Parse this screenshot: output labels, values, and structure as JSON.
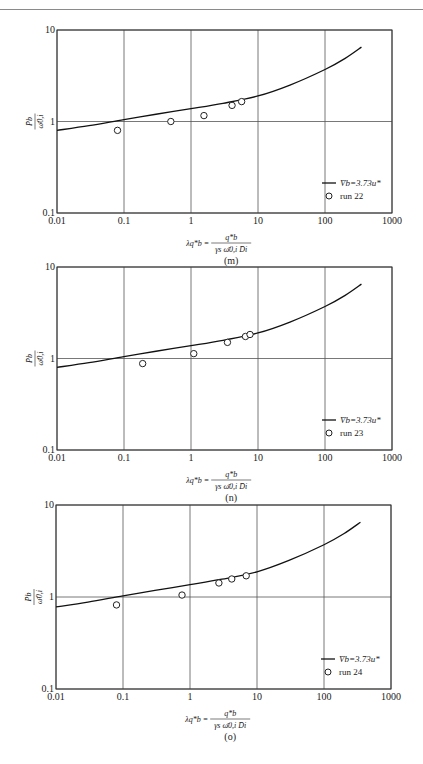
{
  "page_header": {
    "text": "······"
  },
  "chart_data": [
    {
      "id": "m",
      "type": "scatter",
      "title": "",
      "caption": "(m)",
      "xscale": "log",
      "yscale": "log",
      "xlim": [
        0.01,
        1000
      ],
      "ylim": [
        0.1,
        10
      ],
      "xticks": [
        "0.01",
        "0.1",
        "1",
        "10",
        "100",
        "1000"
      ],
      "yticks": [
        "0.1",
        "1",
        "10"
      ],
      "grid": true,
      "xlabel": "λq*b = q*b / (γs ω̄0,i D̄i)",
      "ylabel": "P̄b / ω̄0,i",
      "legend_position": "lower right",
      "series": [
        {
          "name": "V̄b=3.73u*",
          "kind": "line",
          "x": [
            0.01,
            0.03,
            0.1,
            0.3,
            1,
            3,
            10,
            30,
            100,
            200,
            350
          ],
          "y": [
            0.8,
            0.9,
            1.05,
            1.2,
            1.38,
            1.58,
            1.9,
            2.5,
            3.7,
            4.9,
            6.5
          ]
        },
        {
          "name": "run 22",
          "kind": "markers",
          "marker": "open-circle",
          "x": [
            0.08,
            0.5,
            1.56,
            4.1,
            5.7
          ],
          "y": [
            0.8,
            1.0,
            1.16,
            1.5,
            1.65
          ]
        }
      ]
    },
    {
      "id": "n",
      "type": "scatter",
      "title": "",
      "caption": "(n)",
      "xscale": "log",
      "yscale": "log",
      "xlim": [
        0.01,
        1000
      ],
      "ylim": [
        0.1,
        10
      ],
      "xticks": [
        "0.01",
        "0.1",
        "1",
        "10",
        "100",
        "1000"
      ],
      "yticks": [
        "0.1",
        "1",
        "10"
      ],
      "grid": true,
      "xlabel": "λq*b = q*b / (γs ω̄0,i D̄i)",
      "ylabel": "P̄b / ω̄0,i",
      "legend_position": "lower right",
      "series": [
        {
          "name": "V̄b=3.73u*",
          "kind": "line",
          "x": [
            0.01,
            0.03,
            0.1,
            0.3,
            1,
            3,
            10,
            30,
            100,
            200,
            350
          ],
          "y": [
            0.8,
            0.9,
            1.05,
            1.2,
            1.38,
            1.58,
            1.9,
            2.5,
            3.7,
            4.9,
            6.5
          ]
        },
        {
          "name": "run 23",
          "kind": "markers",
          "marker": "open-circle",
          "x": [
            0.19,
            1.1,
            3.5,
            6.5,
            7.6
          ],
          "y": [
            0.88,
            1.13,
            1.5,
            1.74,
            1.83
          ]
        }
      ]
    },
    {
      "id": "o",
      "type": "scatter",
      "title": "",
      "caption": "(o)",
      "xscale": "log",
      "yscale": "log",
      "xlim": [
        0.01,
        1000
      ],
      "ylim": [
        0.1,
        10
      ],
      "xticks": [
        "0.01",
        "0.1",
        "1",
        "10",
        "100",
        "1000"
      ],
      "yticks": [
        "0.1",
        "1",
        "10"
      ],
      "grid": true,
      "xlabel": "λq*b = q*b / (γs ω̄0,i D̄i)",
      "ylabel": "P̄b / ω̄0,i",
      "legend_position": "lower right",
      "series": [
        {
          "name": "V̄b=3.73u*",
          "kind": "line",
          "x": [
            0.01,
            0.03,
            0.1,
            0.3,
            1,
            3,
            10,
            30,
            100,
            200,
            350
          ],
          "y": [
            0.78,
            0.88,
            1.03,
            1.18,
            1.36,
            1.56,
            1.88,
            2.5,
            3.7,
            4.9,
            6.5
          ]
        },
        {
          "name": "run 24",
          "kind": "markers",
          "marker": "open-circle",
          "x": [
            0.08,
            0.76,
            2.7,
            4.2,
            6.9
          ],
          "y": [
            0.82,
            1.05,
            1.42,
            1.57,
            1.7
          ]
        }
      ]
    }
  ],
  "layout": {
    "charts": [
      {
        "top": 30,
        "left": 57,
        "width": 335,
        "height": 183
      },
      {
        "top": 267,
        "left": 57,
        "width": 335,
        "height": 183
      },
      {
        "top": 505,
        "left": 56,
        "width": 335,
        "height": 184
      }
    ]
  },
  "colors": {
    "axis": "#333333",
    "grid": "#555555",
    "line": "#111111",
    "marker": "#222222"
  }
}
